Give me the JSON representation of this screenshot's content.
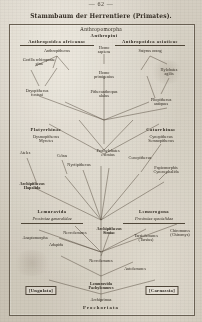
{
  "page": {
    "number": "— 62 —",
    "title": "Stammbaum der Herrentiere (Primates)."
  },
  "diagram": {
    "type": "phylogenetic-tree",
    "root_label": "Prochoriata",
    "headings": {
      "anthropomorpha": "Anthropomorpha",
      "anthropini": "Anthropini"
    },
    "groups": [
      {
        "id": "anthropoidea-africanae",
        "label": "Anthropoidea africanae",
        "x": 48,
        "y": 16
      },
      {
        "id": "anthropoidea-asiaticae",
        "label": "Anthropoidea asiaticae",
        "x": 141,
        "y": 16
      },
      {
        "id": "platyrrhinae",
        "label": "Platyrrhinae",
        "x": 37,
        "y": 104
      },
      {
        "id": "catarrhinae",
        "label": "Catarrhinae",
        "x": 152,
        "y": 104
      },
      {
        "id": "lemuravida",
        "label": "Lemuravida",
        "x": 43,
        "y": 186
      },
      {
        "id": "lemurogona",
        "label": "Lemurogona",
        "x": 145,
        "y": 186
      }
    ],
    "subtitles": [
      {
        "id": "prosimiae-generalidae",
        "label": "Prosimiae generalidae",
        "x": 43,
        "y": 193
      },
      {
        "id": "prosimiae-specialidae",
        "label": "Prosimiae specialidae",
        "x": 145,
        "y": 193
      }
    ],
    "taxa": [
      {
        "id": "homo-sapiens",
        "label": "Homo\nsapiens",
        "x": 95,
        "y": 22,
        "style": "gen"
      },
      {
        "id": "anthropithecus",
        "label": "Anthropithecus",
        "x": 48,
        "y": 25,
        "style": "gen"
      },
      {
        "id": "satyrus-orang",
        "label": "Satyrus orang",
        "x": 141,
        "y": 25,
        "style": "gen"
      },
      {
        "id": "gorilla-schimpanse",
        "label": "Gorilla  schimpanse\ngina",
        "x": 30,
        "y": 34,
        "style": "gen"
      },
      {
        "id": "homo-primigenius",
        "label": "Homo\nprimigenius",
        "x": 95,
        "y": 47,
        "style": "gen"
      },
      {
        "id": "hylobates-agilis",
        "label": "Hylobates\nagilis",
        "x": 160,
        "y": 44,
        "style": "gen"
      },
      {
        "id": "dryopithecus-fontani",
        "label": "Dryopithecus\nfontani",
        "x": 28,
        "y": 65,
        "style": "gen"
      },
      {
        "id": "pithecanthropus",
        "label": "Pithecanthropus\nalalus",
        "x": 95,
        "y": 66,
        "style": "gen"
      },
      {
        "id": "pliopithecus-antiquus",
        "label": "Pliopithecus\nantiquus",
        "x": 152,
        "y": 74,
        "style": "gen"
      },
      {
        "id": "dysmopithecus",
        "label": "Dysmopithecus\nMycetes",
        "x": 37,
        "y": 111,
        "style": "gen"
      },
      {
        "id": "cynopithecus",
        "label": "Cynopithecus\nSemnopithecus",
        "x": 152,
        "y": 111,
        "style": "gen"
      },
      {
        "id": "ateles",
        "label": "Ateles",
        "x": 16,
        "y": 127,
        "style": "gen"
      },
      {
        "id": "cebus",
        "label": "Cebus",
        "x": 53,
        "y": 130,
        "style": "gen"
      },
      {
        "id": "prothylobates",
        "label": "Prothylobates\neximius",
        "x": 99,
        "y": 125,
        "style": "gen"
      },
      {
        "id": "cenopithecus",
        "label": "Cenopithecus",
        "x": 131,
        "y": 132,
        "style": "gen"
      },
      {
        "id": "nyctipithecus",
        "label": "Nyctipithecus",
        "x": 70,
        "y": 139,
        "style": "gen"
      },
      {
        "id": "papiomorphis",
        "label": "Papiomorphis\nCynocephalida",
        "x": 157,
        "y": 142,
        "style": "gen"
      },
      {
        "id": "archipithecus-hapalida",
        "label": "Archipithecus\nHapalida",
        "x": 23,
        "y": 158,
        "style": "genb"
      },
      {
        "id": "anaptomorpha",
        "label": "Anaptomorpha",
        "x": 26,
        "y": 212,
        "style": "gen"
      },
      {
        "id": "necrolemures-top",
        "label": "Necrolemures",
        "x": 66,
        "y": 207,
        "style": "gen"
      },
      {
        "id": "archipithecus-similae",
        "label": "Archipithecus\nSimiae",
        "x": 100,
        "y": 203,
        "style": "genb"
      },
      {
        "id": "tarsiolemures",
        "label": "Tarsiolemures\n(Tarsius)",
        "x": 137,
        "y": 210,
        "style": "gen"
      },
      {
        "id": "chiromures",
        "label": "Chiromures\n(Chiromys)",
        "x": 171,
        "y": 205,
        "style": "gen"
      },
      {
        "id": "adapida",
        "label": "Adapida",
        "x": 47,
        "y": 219,
        "style": "gen"
      },
      {
        "id": "necrolemures-bottom",
        "label": "Necrolemures",
        "x": 92,
        "y": 235,
        "style": "gen"
      },
      {
        "id": "autolemures",
        "label": "Autolemures",
        "x": 126,
        "y": 243,
        "style": "gen"
      },
      {
        "id": "lemuravida-pachylemures",
        "label": "Lemuravida\nPachylemures",
        "x": 92,
        "y": 258,
        "style": "genb"
      },
      {
        "id": "archiprimas",
        "label": "Archiprimas",
        "x": 92,
        "y": 274,
        "style": "gen"
      }
    ],
    "boxes": [
      {
        "id": "ungulata",
        "label": "[Ungulata]",
        "x": 32,
        "y": 262
      },
      {
        "id": "carnassia",
        "label": "[Carnassia]",
        "x": 153,
        "y": 262
      }
    ],
    "root": {
      "label": "Prochoriata",
      "x": 92,
      "y": 282
    }
  }
}
